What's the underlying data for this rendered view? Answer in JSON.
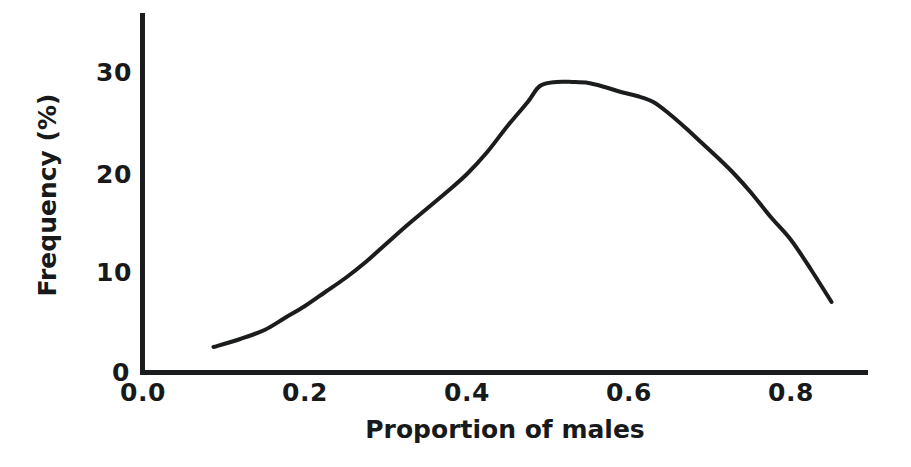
{
  "chart_data": {
    "type": "line",
    "title": "",
    "xlabel": "Proportion of males",
    "ylabel": "Frequency (%)",
    "xlim": [
      0.0,
      0.895
    ],
    "ylim": [
      0,
      36
    ],
    "xticks": [
      "0.0",
      "0.2",
      "0.4",
      "0.6",
      "0.8"
    ],
    "xtick_values": [
      0.0,
      0.2,
      0.4,
      0.6,
      0.8
    ],
    "yticks": [
      "0",
      "10",
      "20",
      "30"
    ],
    "ytick_values": [
      0,
      10,
      20,
      30
    ],
    "grid": false,
    "legend": null,
    "line_color": "#1a1c1d",
    "line_width": 4,
    "x": [
      0.087,
      0.12,
      0.15,
      0.175,
      0.2,
      0.225,
      0.25,
      0.275,
      0.3,
      0.325,
      0.35,
      0.375,
      0.4,
      0.425,
      0.45,
      0.475,
      0.49,
      0.51,
      0.53,
      0.55,
      0.57,
      0.59,
      0.61,
      0.63,
      0.65,
      0.67,
      0.69,
      0.71,
      0.73,
      0.75,
      0.775,
      0.8,
      0.825,
      0.85
    ],
    "values": [
      2.5,
      3.3,
      4.2,
      5.4,
      6.6,
      8.0,
      9.4,
      11.0,
      12.8,
      14.6,
      16.3,
      18.0,
      19.8,
      22.0,
      24.6,
      27.0,
      28.6,
      29.0,
      29.0,
      28.9,
      28.5,
      28.0,
      27.6,
      27.0,
      25.8,
      24.4,
      22.9,
      21.4,
      19.8,
      18.0,
      15.5,
      13.2,
      10.2,
      7.0
    ]
  },
  "axis": {
    "y_label_text": "Frequency (%)",
    "x_label_text": "Proportion of males"
  }
}
